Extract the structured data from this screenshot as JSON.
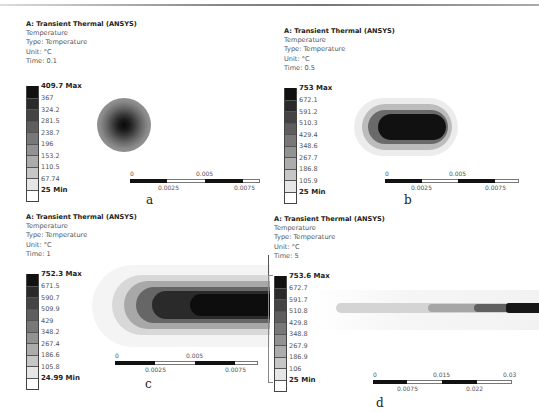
{
  "figure": {
    "panels": [
      {
        "id": "a",
        "caption": "a",
        "title": "A: Transient Thermal (ANSYS)",
        "result": "Temperature",
        "type": "Type: Temperature",
        "unit": "Unit: °C",
        "time": "Time: 0.1",
        "legend": [
          "409.7 Max",
          "367",
          "324.2",
          "281.5",
          "238.7",
          "196",
          "153.2",
          "110.5",
          "67.74",
          "25 Min"
        ],
        "scale": [
          "0",
          "0.0025",
          "0.005",
          "0.0075"
        ]
      },
      {
        "id": "b",
        "caption": "b",
        "title": "A: Transient Thermal (ANSYS)",
        "result": "Temperature",
        "type": "Type: Temperature",
        "unit": "Unit: °C",
        "time": "Time: 0.5",
        "legend": [
          "753 Max",
          "672.1",
          "591.2",
          "510.3",
          "429.4",
          "348.6",
          "267.7",
          "186.8",
          "105.9",
          "25 Min"
        ],
        "scale": [
          "0",
          "0.0025",
          "0.005",
          "0.0075"
        ]
      },
      {
        "id": "c",
        "caption": "c",
        "title": "A: Transient Thermal (ANSYS)",
        "result": "Temperature",
        "type": "Type: Temperature",
        "unit": "Unit: °C",
        "time": "Time: 1",
        "legend": [
          "752.3 Max",
          "671.5",
          "590.7",
          "509.9",
          "429",
          "348.2",
          "267.4",
          "186.6",
          "105.8",
          "24.99 Min"
        ],
        "scale": [
          "0",
          "0.0025",
          "0.005",
          "0.0075"
        ]
      },
      {
        "id": "d",
        "caption": "d",
        "title": "A: Transient Thermal (ANSYS)",
        "result": "Temperature",
        "type": "Type: Temperature",
        "unit": "Unit: °C",
        "time": "Time: 5",
        "legend": [
          "753.6 Max",
          "672.7",
          "591.7",
          "510.8",
          "429.8",
          "348.8",
          "267.9",
          "186.9",
          "106",
          "25 Min"
        ],
        "scale": [
          "0",
          "0.0075",
          "0.015",
          "0.022",
          "0.03"
        ]
      }
    ],
    "legend_colors": [
      "#111111",
      "#2a2a2a",
      "#444444",
      "#5e5e5e",
      "#787878",
      "#929292",
      "#acacac",
      "#c6c6c6",
      "#e0e0e0",
      "#fafafa"
    ]
  }
}
